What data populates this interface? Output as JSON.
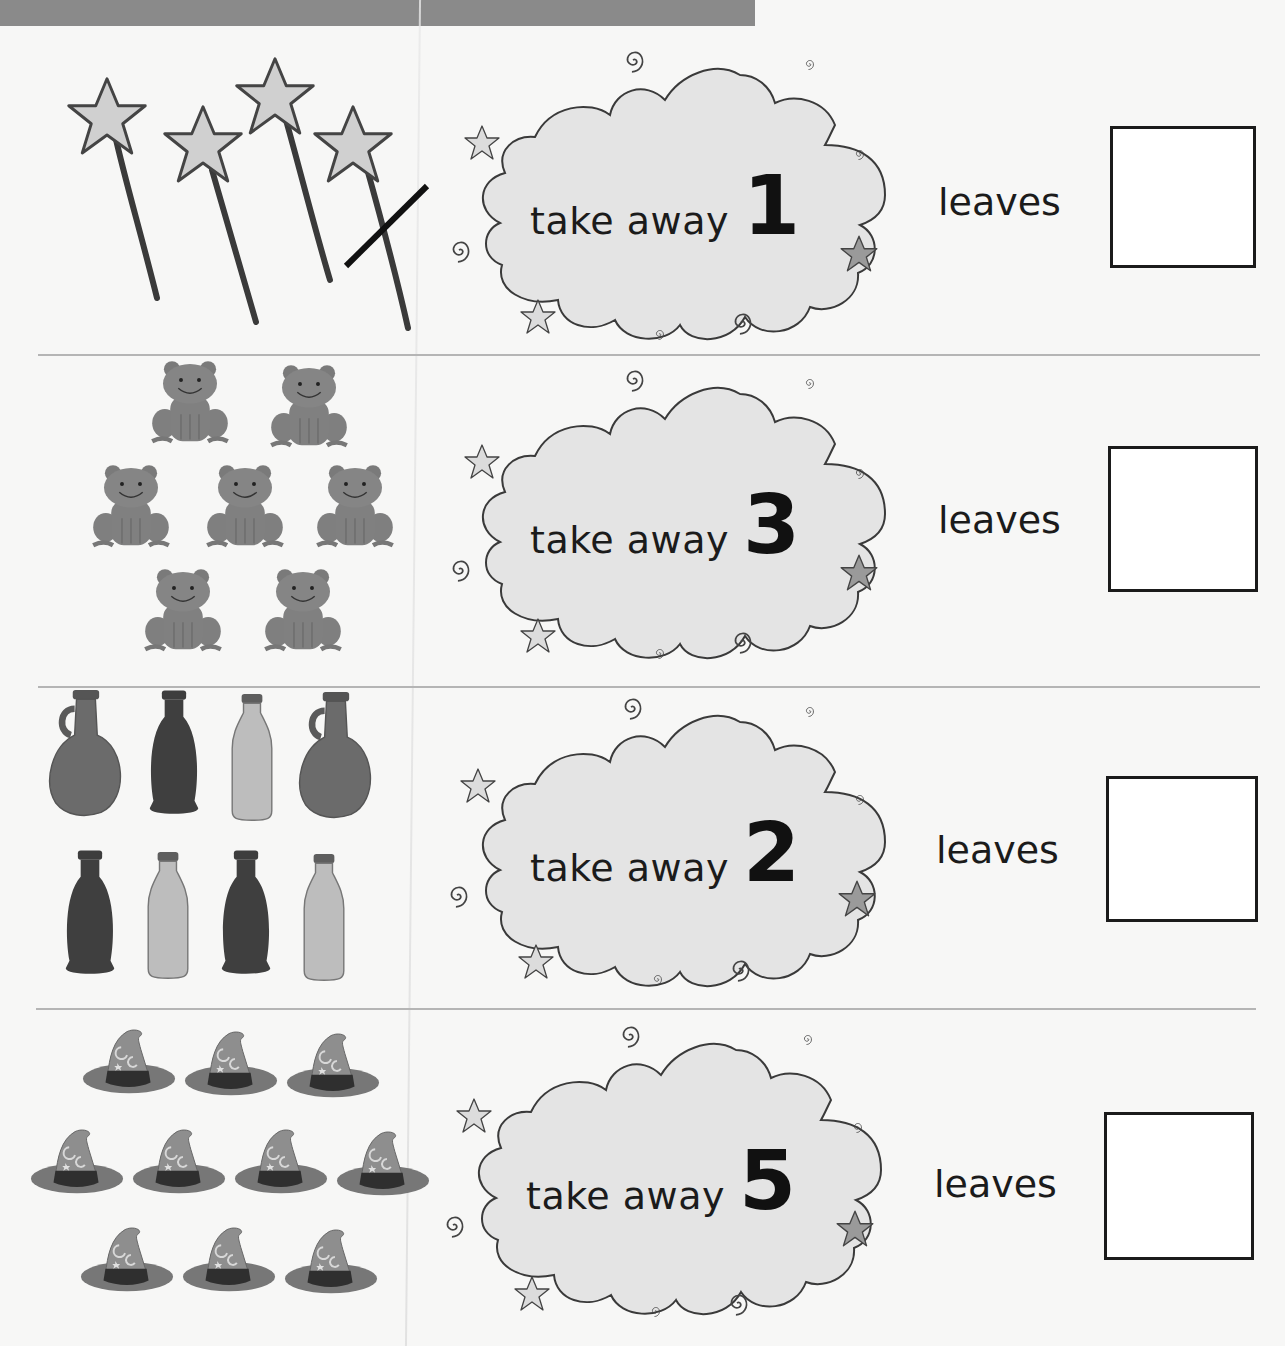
{
  "worksheet": {
    "colors": {
      "header_bar": "#8a8a8a",
      "cloud_fill": "#e4e4e4",
      "divider": "#b5b5b5",
      "ink": "#1b1b1b"
    },
    "questions": [
      {
        "picture": "wands",
        "picture_count": 4,
        "crossed_out": 1,
        "phrase": "take away",
        "number": "1",
        "result_label": "leaves",
        "answer": ""
      },
      {
        "picture": "frogs",
        "picture_count": 7,
        "crossed_out": 0,
        "phrase": "take away",
        "number": "3",
        "result_label": "leaves",
        "answer": ""
      },
      {
        "picture": "bottles",
        "picture_count": 8,
        "crossed_out": 0,
        "phrase": "take away",
        "number": "2",
        "result_label": "leaves",
        "answer": ""
      },
      {
        "picture": "wizard-hats",
        "picture_count": 10,
        "crossed_out": 0,
        "phrase": "take away",
        "number": "5",
        "result_label": "leaves",
        "answer": ""
      }
    ]
  }
}
